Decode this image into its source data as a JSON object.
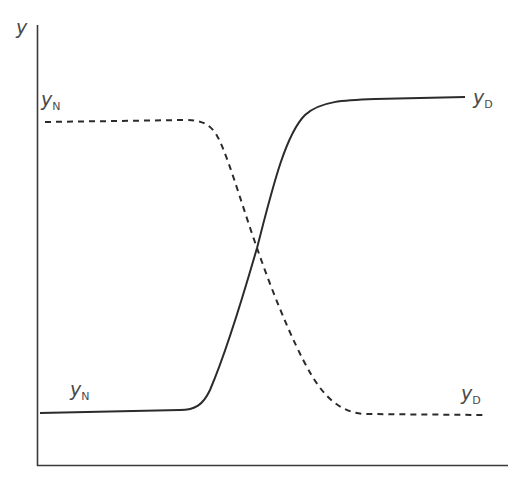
{
  "diagram": {
    "axes": {
      "y_label": "y",
      "x_label": ""
    },
    "curves": [
      {
        "id": "dashed",
        "style": "dashed",
        "left_label": {
          "main": "y",
          "sub": "N"
        },
        "right_label": {
          "main": "y",
          "sub": "D"
        },
        "description": "Starts high at y_N, drops sigmoidally to low y_D"
      },
      {
        "id": "solid",
        "style": "solid",
        "left_label": {
          "main": "y",
          "sub": "N"
        },
        "right_label": {
          "main": "y",
          "sub": "D"
        },
        "description": "Starts low at y_N, rises sigmoidally to high y_D"
      }
    ],
    "colors": {
      "axis": "#3a3a3a",
      "curve": "#2b2b2b",
      "label": "#4a4a4a"
    }
  }
}
